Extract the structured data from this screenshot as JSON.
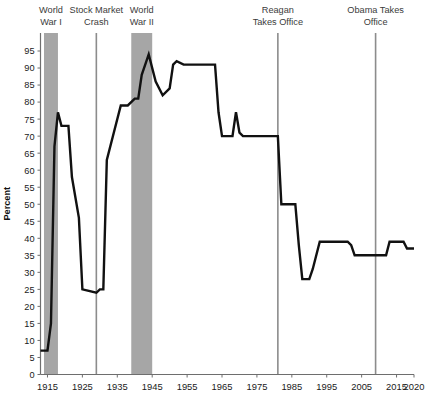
{
  "chart_data": {
    "type": "line",
    "title": "",
    "xlabel": "",
    "ylabel": "Percent",
    "xlim": [
      1913,
      2020
    ],
    "ylim": [
      0,
      97
    ],
    "grid": false,
    "legend": "none",
    "line_color": "#111111",
    "band_color": "#a6a6a6",
    "marker_line_color": "#8c8c8c",
    "axis_color": "#6e6e6e",
    "x_ticks": [
      1915,
      1925,
      1935,
      1945,
      1955,
      1965,
      1975,
      1985,
      1995,
      2005,
      2015,
      2020
    ],
    "y_ticks": [
      0,
      5,
      10,
      15,
      20,
      25,
      30,
      35,
      40,
      45,
      50,
      55,
      60,
      65,
      70,
      75,
      80,
      85,
      90,
      95
    ],
    "annotations": [
      {
        "name": "world-war-i",
        "lines": [
          "World",
          "War I"
        ],
        "kind": "band",
        "start": 1914,
        "end": 1918
      },
      {
        "name": "stock-market-crash",
        "lines": [
          "Stock Market",
          "Crash"
        ],
        "kind": "line",
        "at": 1929
      },
      {
        "name": "world-war-ii",
        "lines": [
          "World",
          "War II"
        ],
        "kind": "band",
        "start": 1939,
        "end": 1945
      },
      {
        "name": "reagan-takes-office",
        "lines": [
          "Reagan",
          "Takes Office"
        ],
        "kind": "line",
        "at": 1981
      },
      {
        "name": "obama-takes-office",
        "lines": [
          "Obama Takes",
          "Office"
        ],
        "kind": "line",
        "at": 2009
      }
    ],
    "series": [
      {
        "name": "Top marginal income tax rate",
        "x": [
          1913,
          1915,
          1916,
          1917,
          1918,
          1919,
          1921,
          1922,
          1924,
          1925,
          1929,
          1930,
          1931,
          1932,
          1936,
          1938,
          1940,
          1941,
          1942,
          1944,
          1946,
          1948,
          1950,
          1951,
          1952,
          1954,
          1963,
          1964,
          1965,
          1968,
          1969,
          1970,
          1971,
          1981,
          1982,
          1986,
          1987,
          1988,
          1990,
          1991,
          1993,
          2001,
          2002,
          2003,
          2009,
          2012,
          2013,
          2017,
          2018,
          2020
        ],
        "y": [
          7,
          7,
          15,
          67,
          77,
          73,
          73,
          58,
          46,
          25,
          24,
          25,
          25,
          63,
          79,
          79,
          81,
          81,
          88,
          94,
          86,
          82,
          84,
          91,
          92,
          91,
          91,
          77,
          70,
          70,
          77,
          71,
          70,
          70,
          50,
          50,
          38,
          28,
          28,
          31,
          39,
          39,
          38,
          35,
          35,
          35,
          39,
          39,
          37,
          37
        ]
      }
    ]
  },
  "axis": {
    "y_title": "Percent"
  }
}
